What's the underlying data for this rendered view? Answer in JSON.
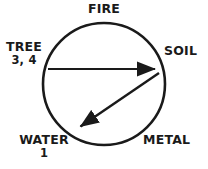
{
  "diagram": {
    "type": "wuxing-cycle-circle",
    "title": "",
    "background_color": "#ffffff",
    "stroke_color": "#1a1a1a",
    "text_color": "#1a1a1a",
    "circle": {
      "center_x": 104,
      "center_y": 84,
      "radius": 61,
      "stroke_width": 2.6
    },
    "nodes": [
      {
        "id": "fire",
        "label": "FIRE",
        "sub": "",
        "position": "top"
      },
      {
        "id": "soil",
        "label": "SOIL",
        "sub": "",
        "position": "right"
      },
      {
        "id": "metal",
        "label": "METAL",
        "sub": "",
        "position": "bottom-right"
      },
      {
        "id": "water",
        "label": "WATER",
        "sub": "1",
        "position": "bottom-left"
      },
      {
        "id": "tree",
        "label": "TREE",
        "sub": "3, 4",
        "position": "left"
      }
    ],
    "arrows": [
      {
        "id": "tree-to-soil",
        "from": "tree",
        "to": "soil",
        "x1": 48,
        "y1": 69,
        "x2": 160,
        "y2": 69,
        "stroke_width": 2.2,
        "head": "end"
      },
      {
        "id": "soil-to-water",
        "from": "soil",
        "to": "water",
        "x1": 159,
        "y1": 73,
        "x2": 75,
        "y2": 130,
        "stroke_width": 2.4,
        "head": "end"
      }
    ]
  }
}
